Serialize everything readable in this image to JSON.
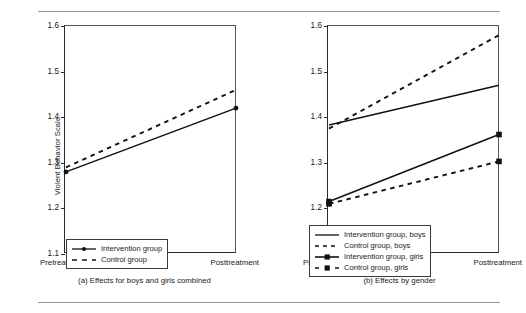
{
  "figure": {
    "y_axis_title": "Violent Behavior Scale",
    "x_tick_left": "Pretreatment",
    "x_tick_right": "Posttreatment",
    "y_ticks": [
      "1.6",
      "1.5",
      "1.4",
      "1.3",
      "1.2",
      "1.1"
    ],
    "caption_a": "(a) Effects for boys and girls combined",
    "caption_b": "(b) Effects by gender",
    "legend_a": [
      {
        "label": "Intervention group",
        "style": "solid-marker"
      },
      {
        "label": "Control group",
        "style": "dashed"
      }
    ],
    "legend_b": [
      {
        "label": "Intervention group, boys",
        "style": "solid"
      },
      {
        "label": "Control group, boys",
        "style": "dashed"
      },
      {
        "label": "Intervention group, girls",
        "style": "solid-marker"
      },
      {
        "label": "Control group, girls",
        "style": "dashed-marker"
      }
    ]
  },
  "chart_data": [
    {
      "type": "line",
      "title": "(a) Effects for boys and girls combined",
      "xlabel": "",
      "ylabel": "Violent Behavior Scale",
      "categories": [
        "Pretreatment",
        "Posttreatment"
      ],
      "ylim": [
        1.1,
        1.6
      ],
      "yticks": [
        1.1,
        1.2,
        1.3,
        1.4,
        1.5,
        1.6
      ],
      "grid": false,
      "legend_position": "inside-bottom-right",
      "series": [
        {
          "name": "Intervention group",
          "values": [
            1.28,
            1.42
          ],
          "style": "solid",
          "marker": "circle"
        },
        {
          "name": "Control group",
          "values": [
            1.29,
            1.46
          ],
          "style": "dashed",
          "marker": "none"
        }
      ]
    },
    {
      "type": "line",
      "title": "(b) Effects by gender",
      "xlabel": "",
      "ylabel": "Violent Behavior Scale",
      "categories": [
        "Pretreatment",
        "Posttreatment"
      ],
      "ylim": [
        1.1,
        1.6
      ],
      "yticks": [
        1.1,
        1.2,
        1.3,
        1.4,
        1.5,
        1.6
      ],
      "grid": false,
      "legend_position": "inside-bottom-center",
      "series": [
        {
          "name": "Intervention group, boys",
          "values": [
            1.383,
            1.47
          ],
          "style": "solid",
          "marker": "none"
        },
        {
          "name": "Control group, boys",
          "values": [
            1.375,
            1.58
          ],
          "style": "dashed",
          "marker": "none"
        },
        {
          "name": "Intervention group, girls",
          "values": [
            1.215,
            1.362
          ],
          "style": "solid",
          "marker": "square"
        },
        {
          "name": "Control group, girls",
          "values": [
            1.21,
            1.303
          ],
          "style": "dashed",
          "marker": "square"
        }
      ]
    }
  ]
}
